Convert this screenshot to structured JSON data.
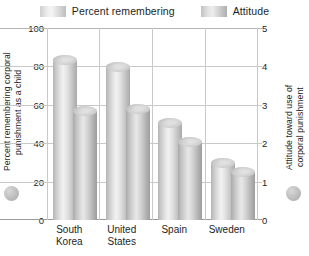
{
  "legend": {
    "entries": [
      {
        "label": "Percent remembering",
        "swatch": "pct",
        "color": "#d9d9d9"
      },
      {
        "label": "Attitude",
        "swatch": "att",
        "color": "#c4c4c4"
      }
    ]
  },
  "axes": {
    "left": {
      "title": "Percent remembering corporal\npunishment as a child",
      "ticks": [
        "0",
        "20",
        "40",
        "60",
        "80",
        "100"
      ],
      "min": 0,
      "max": 100,
      "marker": "gray-circle"
    },
    "right": {
      "title": "Attitude toward use of\ncorporal punishment",
      "ticks": [
        "0",
        "1",
        "2",
        "3",
        "4",
        "5"
      ],
      "min": 0,
      "max": 5,
      "marker": "gray-circle"
    }
  },
  "chart_data": {
    "type": "bar",
    "title": "",
    "xlabel": "",
    "ylabel": "Percent remembering corporal punishment as a child",
    "y2label": "Attitude toward use of corporal punishment",
    "categories": [
      "South Korea",
      "United States",
      "Spain",
      "Sweden"
    ],
    "category_lines": [
      [
        "South",
        "Korea"
      ],
      [
        "United",
        "States"
      ],
      [
        "Spain"
      ],
      [
        "Sweden"
      ]
    ],
    "series": [
      {
        "name": "Percent remembering",
        "axis": "left",
        "values": [
          84,
          80,
          51,
          30
        ],
        "color": "#d9d9d9"
      },
      {
        "name": "Attitude",
        "axis": "right",
        "values": [
          2.85,
          2.9,
          2.05,
          1.25
        ],
        "color": "#c4c4c4"
      }
    ],
    "ylim": [
      0,
      100
    ],
    "y2lim": [
      0,
      5
    ],
    "yticks": [
      0,
      20,
      40,
      60,
      80,
      100
    ],
    "y2ticks": [
      0,
      1,
      2,
      3,
      4,
      5
    ],
    "grid": true,
    "legend_position": "top"
  }
}
